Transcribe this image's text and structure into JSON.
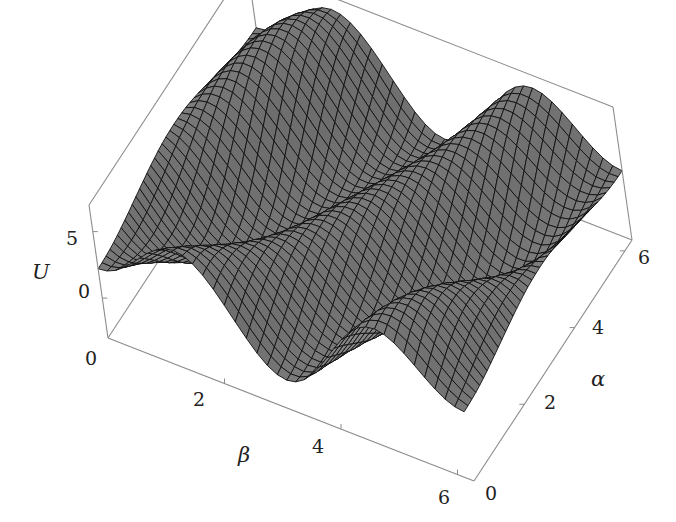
{
  "chart_data": {
    "type": "surface3d",
    "title": "",
    "function_description": "Periodic potential U(alpha, beta) with diagonal ridges/valleys, period 2*pi in both alpha and beta",
    "x_axis": {
      "label": "β",
      "ticks": [
        "0",
        "2",
        "4",
        "6"
      ],
      "range": [
        0,
        6.283
      ]
    },
    "y_axis": {
      "label": "α",
      "ticks": [
        "0",
        "2",
        "4",
        "6"
      ],
      "range": [
        0,
        6.283
      ]
    },
    "z_axis": {
      "label": "U",
      "ticks": [
        "0",
        "5"
      ],
      "range": [
        -3,
        7
      ]
    },
    "mesh": {
      "lines_per_axis": 40,
      "face_color": "#7a7a7a",
      "line_color": "#111111"
    },
    "box": {
      "edge_color": "#8c8c8c",
      "visible": true
    },
    "features": [
      "Three dark diagonal valleys running from lower-left to upper-right",
      "Wavy ridges between valleys, peaks near U≈5-6",
      "Front edges show oscillating profile"
    ]
  },
  "labels": {
    "z_title": "U",
    "z_ticks": [
      {
        "text": "5"
      },
      {
        "text": "0"
      },
      {
        "text": "0"
      }
    ],
    "beta_title": "β",
    "beta_ticks": [
      {
        "text": "2"
      },
      {
        "text": "4"
      },
      {
        "text": "6"
      }
    ],
    "alpha_title": "α",
    "alpha_ticks": [
      {
        "text": "0"
      },
      {
        "text": "2"
      },
      {
        "text": "4"
      },
      {
        "text": "6"
      }
    ]
  }
}
